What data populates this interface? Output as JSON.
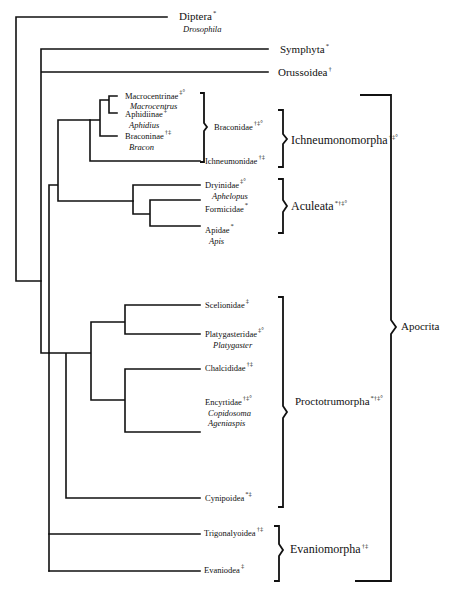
{
  "figure": {
    "type": "phylogenetic-tree",
    "title": "",
    "colors": {
      "line": "#111111",
      "background": "#ffffff"
    }
  },
  "leaves": {
    "diptera": {
      "name": "Diptera",
      "marks": "*",
      "genus": "Drosophila"
    },
    "symphyta": {
      "name": "Symphyta",
      "marks": "*"
    },
    "orussoidea": {
      "name": "Orussoidea",
      "marks": "†"
    },
    "macrocentrinae": {
      "name": "Macrocentrinae",
      "marks": "‡°",
      "genus": "Macrocentrus"
    },
    "aphidiinae": {
      "name": "Aphidiinae",
      "marks": "‡",
      "genus": "Aphidius"
    },
    "braconinae": {
      "name": "Braconinae",
      "marks": "†‡",
      "genus": "Bracon"
    },
    "ichneumonidae": {
      "name": "Ichneumonidae",
      "marks": "†‡"
    },
    "dryinidae": {
      "name": "Dryinidae",
      "marks": "‡°",
      "genus": "Aphelopus"
    },
    "formicidae": {
      "name": "Formicidae",
      "marks": "*"
    },
    "apidae": {
      "name": "Apidae",
      "marks": "*",
      "genus": "Apis"
    },
    "scelionidae": {
      "name": "Scelionidae",
      "marks": "‡"
    },
    "platygasteridae": {
      "name": "Platygasteridae",
      "marks": "‡°",
      "genus": "Platygaster"
    },
    "chalcididae": {
      "name": "Chalcididae",
      "marks": "†‡"
    },
    "encyrtidae": {
      "name": "Encyrtidae",
      "marks": "†‡°",
      "genus": "Copidosoma",
      "genus2": "Ageniaspis"
    },
    "cynipoidea": {
      "name": "Cynipoidea",
      "marks": "*‡"
    },
    "trigonalyoidea": {
      "name": "Trigonalyoidea",
      "marks": "†‡"
    },
    "evaniodea": {
      "name": "Evaniodea",
      "marks": "‡"
    }
  },
  "groups": {
    "braconidae": {
      "name": "Braconidae",
      "marks": "†‡°"
    },
    "ichneumonomorpha": {
      "name": "Ichneumonomorpha",
      "marks": "†‡°"
    },
    "aculeata": {
      "name": "Aculeata",
      "marks": "*†‡°"
    },
    "proctotrupomorpha": {
      "name": "Proctotrumorpha",
      "marks": "*†‡°"
    },
    "evaniomorpha": {
      "name": "Evaniomorpha",
      "marks": "†‡"
    },
    "apocrita": {
      "name": "Apocrita"
    }
  }
}
